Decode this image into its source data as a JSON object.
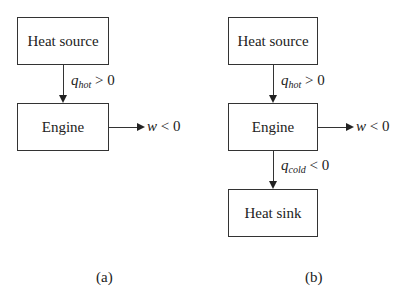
{
  "diagram_a": {
    "caption": "(a)",
    "nodes": {
      "source": "Heat source",
      "engine": "Engine"
    },
    "edges": {
      "q_hot": {
        "symbol": "q",
        "subscript": "hot",
        "relation": "> 0"
      },
      "work": {
        "symbol": "w",
        "relation": "< 0"
      }
    }
  },
  "diagram_b": {
    "caption": "(b)",
    "nodes": {
      "source": "Heat source",
      "engine": "Engine",
      "sink": "Heat sink"
    },
    "edges": {
      "q_hot": {
        "symbol": "q",
        "subscript": "hot",
        "relation": "> 0"
      },
      "work": {
        "symbol": "w",
        "relation": "< 0"
      },
      "q_cold": {
        "symbol": "q",
        "subscript": "cold",
        "relation": "< 0"
      }
    }
  }
}
